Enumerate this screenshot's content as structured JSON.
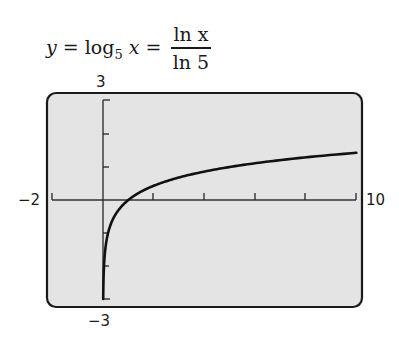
{
  "title": {
    "lhs_var": "y",
    "eq1": " = log",
    "base": "5",
    "arg": " x",
    "eq2": " =",
    "numerator": "ln x",
    "denominator": "ln 5"
  },
  "axis_labels": {
    "xmin": "−2",
    "xmax": "10",
    "ymax": "3",
    "ymin": "−3"
  },
  "colors": {
    "screen_bg": "#e4e4e4",
    "frame": "#1a1a1a",
    "curve": "#111111",
    "axes": "#333333"
  },
  "chart_data": {
    "type": "line",
    "xlabel": "",
    "ylabel": "",
    "xlim": [
      -2,
      10
    ],
    "ylim": [
      -3,
      3
    ],
    "xscale_tick": 2,
    "yscale_tick": 1,
    "grid": false,
    "series": [
      {
        "name": "y = log_5 x",
        "x": [
          0.008,
          0.02,
          0.04,
          0.1,
          0.2,
          0.4,
          0.6,
          1,
          1.5,
          2,
          3,
          4,
          5,
          6,
          7,
          8,
          9,
          10
        ],
        "values": [
          -3.0,
          -2.43,
          -2.0,
          -1.43,
          -1.0,
          -0.57,
          -0.32,
          0,
          0.25,
          0.43,
          0.68,
          0.86,
          1.0,
          1.11,
          1.21,
          1.29,
          1.37,
          1.43
        ]
      }
    ]
  }
}
